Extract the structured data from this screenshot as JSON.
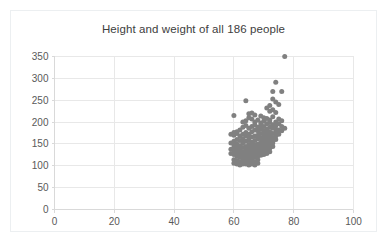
{
  "chart_data": {
    "type": "scatter",
    "title": "Height and weight of all 186 people",
    "xlabel": "",
    "ylabel": "",
    "xlim": [
      0,
      100
    ],
    "ylim": [
      0,
      350
    ],
    "xticks": [
      0,
      20,
      40,
      60,
      80,
      100
    ],
    "yticks": [
      0,
      50,
      100,
      150,
      200,
      250,
      300,
      350
    ],
    "grid": true,
    "legend": false,
    "marker_color": "#808080",
    "marker_size": 5,
    "series": [
      {
        "name": "people",
        "n": 186,
        "points": [
          [
            77,
            350
          ],
          [
            74,
            291
          ],
          [
            73,
            270
          ],
          [
            76,
            270
          ],
          [
            64,
            249
          ],
          [
            73,
            253
          ],
          [
            74,
            246
          ],
          [
            75,
            240
          ],
          [
            72,
            238
          ],
          [
            71,
            232
          ],
          [
            73,
            228
          ],
          [
            72,
            225
          ],
          [
            74,
            222
          ],
          [
            60,
            215
          ],
          [
            65,
            219
          ],
          [
            66,
            221
          ],
          [
            67,
            216
          ],
          [
            63,
            200
          ],
          [
            64,
            203
          ],
          [
            69,
            214
          ],
          [
            70,
            210
          ],
          [
            71,
            208
          ],
          [
            72,
            205
          ],
          [
            73,
            212
          ],
          [
            75,
            207
          ],
          [
            76,
            203
          ],
          [
            74,
            200
          ],
          [
            70,
            202
          ],
          [
            69,
            198
          ],
          [
            68,
            205
          ],
          [
            67,
            200
          ],
          [
            66,
            207
          ],
          [
            65,
            210
          ],
          [
            71,
            196
          ],
          [
            72,
            199
          ],
          [
            73,
            194
          ],
          [
            74,
            192
          ],
          [
            75,
            196
          ],
          [
            76,
            190
          ],
          [
            77,
            186
          ],
          [
            70,
            190
          ],
          [
            69,
            192
          ],
          [
            68,
            188
          ],
          [
            67,
            194
          ],
          [
            66,
            190
          ],
          [
            65,
            186
          ],
          [
            64,
            192
          ],
          [
            63,
            188
          ],
          [
            62,
            182
          ],
          [
            61,
            178
          ],
          [
            60,
            176
          ],
          [
            59,
            172
          ],
          [
            60,
            170
          ],
          [
            61,
            174
          ],
          [
            62,
            168
          ],
          [
            63,
            172
          ],
          [
            64,
            176
          ],
          [
            65,
            172
          ],
          [
            66,
            178
          ],
          [
            67,
            182
          ],
          [
            68,
            180
          ],
          [
            69,
            184
          ],
          [
            70,
            180
          ],
          [
            71,
            184
          ],
          [
            72,
            188
          ],
          [
            73,
            186
          ],
          [
            74,
            184
          ],
          [
            75,
            182
          ],
          [
            76,
            180
          ],
          [
            72,
            178
          ],
          [
            71,
            176
          ],
          [
            70,
            172
          ],
          [
            69,
            174
          ],
          [
            68,
            170
          ],
          [
            67,
            168
          ],
          [
            66,
            166
          ],
          [
            65,
            164
          ],
          [
            64,
            168
          ],
          [
            63,
            162
          ],
          [
            62,
            158
          ],
          [
            61,
            160
          ],
          [
            60,
            156
          ],
          [
            59,
            152
          ],
          [
            60,
            148
          ],
          [
            61,
            150
          ],
          [
            62,
            146
          ],
          [
            63,
            152
          ],
          [
            64,
            156
          ],
          [
            65,
            158
          ],
          [
            66,
            154
          ],
          [
            67,
            158
          ],
          [
            68,
            162
          ],
          [
            69,
            164
          ],
          [
            70,
            166
          ],
          [
            71,
            168
          ],
          [
            72,
            170
          ],
          [
            73,
            174
          ],
          [
            74,
            176
          ],
          [
            75,
            172
          ],
          [
            74,
            168
          ],
          [
            73,
            164
          ],
          [
            72,
            162
          ],
          [
            71,
            160
          ],
          [
            70,
            158
          ],
          [
            69,
            154
          ],
          [
            68,
            150
          ],
          [
            67,
            148
          ],
          [
            66,
            146
          ],
          [
            65,
            148
          ],
          [
            64,
            144
          ],
          [
            63,
            142
          ],
          [
            62,
            138
          ],
          [
            61,
            140
          ],
          [
            60,
            136
          ],
          [
            59,
            138
          ],
          [
            60,
            142
          ],
          [
            61,
            134
          ],
          [
            62,
            130
          ],
          [
            63,
            132
          ],
          [
            64,
            136
          ],
          [
            65,
            138
          ],
          [
            66,
            140
          ],
          [
            67,
            142
          ],
          [
            68,
            144
          ],
          [
            69,
            146
          ],
          [
            70,
            150
          ],
          [
            71,
            152
          ],
          [
            72,
            156
          ],
          [
            73,
            158
          ],
          [
            74,
            160
          ],
          [
            73,
            152
          ],
          [
            72,
            148
          ],
          [
            71,
            144
          ],
          [
            70,
            142
          ],
          [
            69,
            138
          ],
          [
            68,
            136
          ],
          [
            67,
            134
          ],
          [
            66,
            132
          ],
          [
            65,
            130
          ],
          [
            64,
            128
          ],
          [
            63,
            126
          ],
          [
            62,
            124
          ],
          [
            61,
            122
          ],
          [
            60,
            126
          ],
          [
            59,
            128
          ],
          [
            60,
            130
          ],
          [
            61,
            128
          ],
          [
            62,
            120
          ],
          [
            63,
            118
          ],
          [
            64,
            122
          ],
          [
            65,
            124
          ],
          [
            66,
            126
          ],
          [
            67,
            128
          ],
          [
            68,
            130
          ],
          [
            69,
            132
          ],
          [
            70,
            134
          ],
          [
            71,
            136
          ],
          [
            72,
            140
          ],
          [
            73,
            144
          ],
          [
            72,
            132
          ],
          [
            71,
            128
          ],
          [
            70,
            126
          ],
          [
            69,
            124
          ],
          [
            68,
            122
          ],
          [
            67,
            120
          ],
          [
            66,
            118
          ],
          [
            65,
            116
          ],
          [
            64,
            114
          ],
          [
            63,
            112
          ],
          [
            62,
            110
          ],
          [
            61,
            112
          ],
          [
            60,
            114
          ],
          [
            61,
            108
          ],
          [
            62,
            106
          ],
          [
            63,
            108
          ],
          [
            64,
            110
          ],
          [
            65,
            108
          ],
          [
            66,
            112
          ],
          [
            67,
            110
          ],
          [
            68,
            114
          ],
          [
            66,
            104
          ],
          [
            67,
            102
          ],
          [
            65,
            102
          ],
          [
            64,
            104
          ],
          [
            63,
            104
          ],
          [
            62,
            102
          ],
          [
            61,
            104
          ],
          [
            60,
            106
          ],
          [
            68,
            106
          ]
        ]
      }
    ]
  }
}
